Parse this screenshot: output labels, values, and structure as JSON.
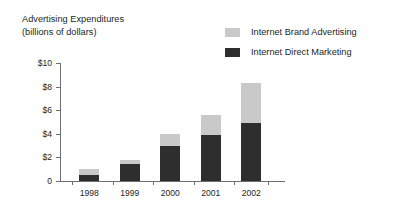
{
  "title": {
    "line1": "Advertising Expenditures",
    "line2": "(billions of dollars)"
  },
  "legend": {
    "position": "top-right",
    "items": [
      {
        "label": "Internet Brand Advertising",
        "color": "#c9c9c9",
        "swatch_name": "legend-swatch-brand"
      },
      {
        "label": "Internet Direct Marketing",
        "color": "#2e2e2e",
        "swatch_name": "legend-swatch-direct"
      }
    ]
  },
  "axes": {
    "y_tick_labels": [
      "$10",
      "$8",
      "$6",
      "$4",
      "$2",
      "0"
    ],
    "y_tick_values": [
      10,
      8,
      6,
      4,
      2,
      0
    ],
    "x_tick_labels": [
      "1998",
      "1999",
      "2000",
      "2001",
      "2002"
    ]
  },
  "chart_data": {
    "type": "bar",
    "subtype": "stacked-vertical",
    "title": "Advertising Expenditures (billions of dollars)",
    "xlabel": "",
    "ylabel": "",
    "ylim": [
      0,
      10
    ],
    "yticks": [
      0,
      2,
      4,
      6,
      8,
      10
    ],
    "ytick_labels": [
      "0",
      "$2",
      "$4",
      "$6",
      "$8",
      "$10"
    ],
    "grid": false,
    "legend_position": "top-right",
    "categories": [
      "1998",
      "1999",
      "2000",
      "2001",
      "2002"
    ],
    "series": [
      {
        "name": "Internet Direct Marketing",
        "color": "#2e2e2e",
        "values": [
          0.5,
          1.4,
          3.0,
          3.9,
          4.9
        ]
      },
      {
        "name": "Internet Brand Advertising",
        "color": "#c9c9c9",
        "values": [
          0.5,
          0.4,
          1.0,
          1.7,
          3.4
        ]
      }
    ],
    "totals": [
      1.0,
      1.8,
      4.0,
      5.6,
      8.3
    ],
    "stack_order_bottom_to_top": [
      "Internet Direct Marketing",
      "Internet Brand Advertising"
    ]
  },
  "style": {
    "axis_color": "#6d6e71",
    "text_color": "#231f20",
    "background": "#ffffff"
  }
}
